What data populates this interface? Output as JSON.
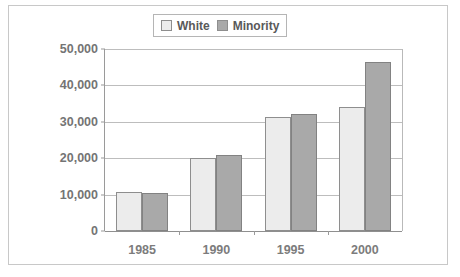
{
  "figure": {
    "title_remnant": "",
    "background_color": "#ffffff",
    "frame_color": "#c8c8c8"
  },
  "legend": {
    "position": "top-center",
    "entries": [
      {
        "label": "White",
        "color": "#ececec",
        "swatch": "white-swatch-icon"
      },
      {
        "label": "Minority",
        "color": "#a9a9a9",
        "swatch": "minority-swatch-icon"
      }
    ]
  },
  "chart_data": {
    "type": "bar",
    "title": "",
    "xlabel": "",
    "ylabel": "",
    "categories": [
      "1985",
      "1990",
      "1995",
      "2000"
    ],
    "series": [
      {
        "name": "White",
        "color": "#ececec",
        "values": [
          10800,
          20000,
          31400,
          34000
        ]
      },
      {
        "name": "Minority",
        "color": "#a9a9a9",
        "values": [
          10500,
          21000,
          32200,
          46300
        ]
      }
    ],
    "ylim": [
      0,
      50000
    ],
    "yticks": [
      0,
      10000,
      20000,
      30000,
      40000,
      50000
    ],
    "ytick_labels": [
      "0",
      "10,000",
      "20,000",
      "30,000",
      "40,000",
      "50,000"
    ],
    "grid": true,
    "legend_position": "top-center"
  }
}
